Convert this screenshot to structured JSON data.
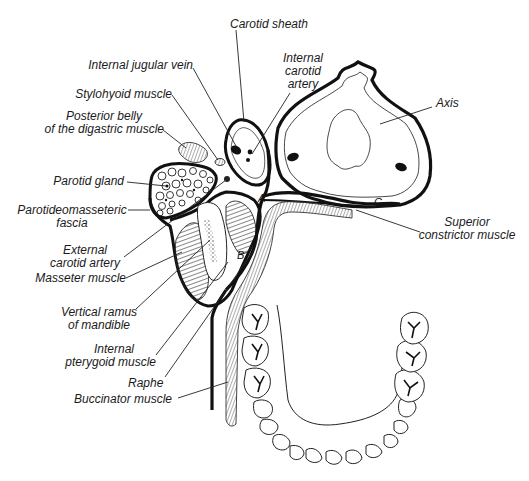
{
  "figure": {
    "type": "anatomical cross-section",
    "background": "#ffffff",
    "ink": "#111111"
  },
  "labels": {
    "carotid_sheath": "Carotid sheath",
    "internal_jugular_vein": "Internal jugular vein",
    "internal_carotid_artery": [
      "Internal",
      "carotid",
      "artery"
    ],
    "stylohyoid_muscle": "Stylohyoid muscle",
    "posterior_belly": [
      "Posterior belly",
      "of the digastric muscle"
    ],
    "axis": "Axis",
    "parotid_gland": "Parotid gland",
    "parotideomasseteric_fascia": [
      "Parotideomasseteric",
      "fascia"
    ],
    "external_carotid_artery": [
      "External",
      "carotid artery"
    ],
    "masseter_muscle": "Masseter muscle",
    "vertical_ramus": [
      "Vertical ramus",
      "of mandible"
    ],
    "internal_pterygoid": [
      "Internal",
      "pterygoid muscle"
    ],
    "raphe": "Raphe",
    "buccinator_muscle": "Buccinator muscle",
    "superior_constrictor": [
      "Superior",
      "constrictor muscle"
    ]
  },
  "point_letters": {
    "a": "A",
    "b": "B",
    "c": "C"
  }
}
